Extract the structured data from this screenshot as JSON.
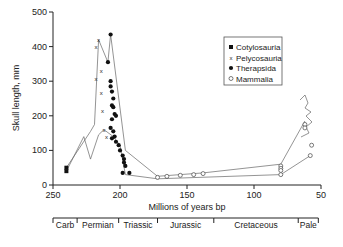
{
  "chart_data": {
    "type": "scatter",
    "title": "",
    "xlabel": "Millions of years bp",
    "ylabel": "Skull length, mm",
    "xlim": [
      250,
      50
    ],
    "ylim": [
      0,
      500
    ],
    "x_ticks": [
      250,
      200,
      150,
      100,
      50
    ],
    "y_ticks": [
      0,
      100,
      200,
      300,
      400,
      500
    ],
    "grid": false,
    "legend_position": "upper right",
    "legend": [
      "Cotylosauria",
      "Pelycosauria",
      "Therapsida",
      "Mammalia"
    ],
    "periods": [
      {
        "label": "Carb",
        "start": 250,
        "end": 232
      },
      {
        "label": "Permian",
        "start": 232,
        "end": 201
      },
      {
        "label": "Triassic",
        "start": 201,
        "end": 172
      },
      {
        "label": "Jurassic",
        "start": 172,
        "end": 130
      },
      {
        "label": "Cretaceous",
        "start": 130,
        "end": 67
      },
      {
        "label": "Pale",
        "start": 67,
        "end": 52
      }
    ],
    "series": [
      {
        "name": "Cotylosauria",
        "marker": "square-filled",
        "points": [
          [
            240,
            40
          ],
          [
            240,
            50
          ]
        ]
      },
      {
        "name": "Pelycosauria",
        "marker": "x",
        "points": [
          [
            218,
            400
          ],
          [
            216,
            420
          ],
          [
            214,
            330
          ],
          [
            218,
            305
          ],
          [
            214,
            265
          ],
          [
            213,
            215
          ],
          [
            212,
            160
          ],
          [
            210,
            140
          ]
        ]
      },
      {
        "name": "Therapsida",
        "marker": "dot-filled",
        "points": [
          [
            207,
            435
          ],
          [
            209,
            355
          ],
          [
            207,
            300
          ],
          [
            207,
            285
          ],
          [
            206,
            270
          ],
          [
            205,
            250
          ],
          [
            206,
            230
          ],
          [
            205,
            225
          ],
          [
            204,
            205
          ],
          [
            203,
            200
          ],
          [
            206,
            190
          ],
          [
            207,
            165
          ],
          [
            205,
            155
          ],
          [
            204,
            140
          ],
          [
            206,
            135
          ],
          [
            203,
            125
          ],
          [
            201,
            115
          ],
          [
            200,
            100
          ],
          [
            198,
            85
          ],
          [
            197,
            75
          ],
          [
            197,
            65
          ],
          [
            196,
            55
          ],
          [
            198,
            35
          ],
          [
            193,
            35
          ]
        ]
      },
      {
        "name": "Mammalia",
        "marker": "circle-open",
        "points": [
          [
            172,
            22
          ],
          [
            165,
            25
          ],
          [
            155,
            28
          ],
          [
            145,
            30
          ],
          [
            138,
            33
          ],
          [
            80,
            55
          ],
          [
            80,
            48
          ],
          [
            80,
            42
          ],
          [
            80,
            30
          ],
          [
            62,
            175
          ],
          [
            62,
            165
          ],
          [
            57,
            115
          ],
          [
            58,
            85
          ]
        ]
      }
    ],
    "envelope_upper": [
      [
        240,
        50
      ],
      [
        222,
        155
      ],
      [
        219,
        175
      ],
      [
        216,
        420
      ],
      [
        209,
        355
      ],
      [
        207,
        435
      ],
      [
        196,
        100
      ],
      [
        172,
        25
      ],
      [
        138,
        35
      ],
      [
        80,
        60
      ],
      [
        62,
        185
      ]
    ],
    "envelope_lower": [
      [
        240,
        40
      ],
      [
        227,
        140
      ],
      [
        222,
        75
      ],
      [
        216,
        145
      ],
      [
        212,
        160
      ],
      [
        205,
        140
      ],
      [
        200,
        115
      ],
      [
        196,
        30
      ],
      [
        172,
        18
      ],
      [
        80,
        30
      ],
      [
        58,
        85
      ]
    ]
  }
}
